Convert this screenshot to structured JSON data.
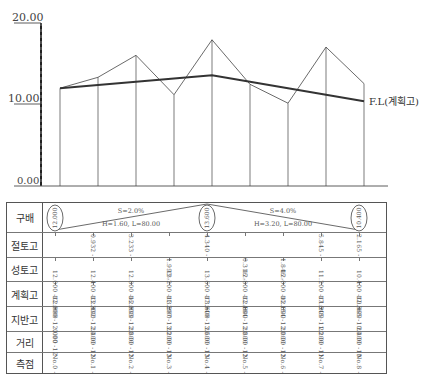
{
  "chart_data": {
    "type": "line",
    "title": "",
    "ylabel": "",
    "xlabel": "",
    "ylim": [
      0,
      20
    ],
    "y_ticks": [
      "0.00",
      "10.00",
      "20.00"
    ],
    "categories": [
      "No.0",
      "No.1",
      "No.2",
      "No.3",
      "No.4",
      "No.5",
      "No.6",
      "No.7",
      "No.8"
    ],
    "series": [
      {
        "name": "지반고",
        "values": [
          12.0,
          13.332,
          16.033,
          11.207,
          17.94,
          12.484,
          10.154,
          17.045,
          12.565
        ]
      },
      {
        "name": "F.L(계획고)",
        "values": [
          12.0,
          12.4,
          12.8,
          13.2,
          13.6,
          12.8,
          12.0,
          11.2,
          10.4
        ]
      }
    ],
    "annotations": [
      "F.L(계획고)"
    ]
  },
  "profile": {
    "y_labels": {
      "top": "20.00",
      "mid": "10.00",
      "bottom": "0.00"
    },
    "fl_label": "F.L(계획고)"
  },
  "table": {
    "rows": [
      {
        "key": "gradient",
        "label": "구배"
      },
      {
        "key": "cut",
        "label": "절토고"
      },
      {
        "key": "fill",
        "label": "성토고"
      },
      {
        "key": "plan",
        "label": "계획고"
      },
      {
        "key": "ground",
        "label": "지반고"
      },
      {
        "key": "distance",
        "label": "거리"
      },
      {
        "key": "station",
        "label": "측점"
      }
    ],
    "gradient": {
      "circles": [
        "12.000",
        "13.600",
        "10.400"
      ],
      "segments": [
        {
          "slope": "S=2.0%",
          "detail": "H=1.60, L=80.00"
        },
        {
          "slope": "S=4.0%",
          "detail": "H=3.20, L=80.00"
        }
      ]
    },
    "cut": [
      {
        "station": 1,
        "value": "0.932"
      },
      {
        "station": 2,
        "value": "3.233"
      },
      {
        "station": 4,
        "value": "4.340"
      },
      {
        "station": 7,
        "value": "5.845"
      },
      {
        "station": 8,
        "value": "2.165"
      }
    ],
    "fill": [
      {
        "station": 3,
        "value": "1.993"
      },
      {
        "station": 5,
        "value": "0.316"
      },
      {
        "station": 6,
        "value": "1.846"
      }
    ],
    "plan": [
      "12.000",
      "12.400",
      "12.800",
      "13.200",
      "13.600",
      "12.800",
      "12.000",
      "11.200",
      "10.400"
    ],
    "ground": [
      "12.000",
      "13.332",
      "16.033",
      "11.207",
      "17.940",
      "12.484",
      "10.154",
      "17.045",
      "12.565"
    ],
    "distance": [
      "0.00",
      "20.00",
      "20.00",
      "20.00",
      "20.00",
      "20.00",
      "20.00",
      "20.00",
      "20.00"
    ],
    "station": [
      "No.0",
      "No.1",
      "No.2",
      "No.3",
      "No.4",
      "No.5",
      "No.6",
      "No.7",
      "No.8"
    ]
  }
}
